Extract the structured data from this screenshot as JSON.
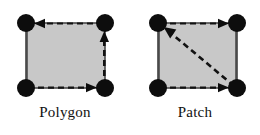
{
  "figure": {
    "background_color": "#ffffff",
    "panels": [
      {
        "id": "polygon",
        "caption": "Polygon",
        "shape": {
          "fill_color": "#c8c8c8",
          "stroke_color": "#4a4a4a",
          "vertices": [
            "top-left",
            "top-right",
            "bottom-right",
            "bottom-left"
          ]
        },
        "vertex_marker": {
          "shape": "filled-circle",
          "color": "#0d0d0d",
          "radius_px": 9,
          "count": 4
        },
        "edges": [
          {
            "name": "top-edge",
            "style": "dashed",
            "arrow": true,
            "direction": "right-to-left"
          },
          {
            "name": "right-edge",
            "style": "dashed",
            "arrow": true,
            "direction": "bottom-to-top"
          },
          {
            "name": "bottom-edge",
            "style": "dashed",
            "arrow": true,
            "direction": "left-to-right"
          },
          {
            "name": "left-edge",
            "style": "solid",
            "arrow": false,
            "direction": "none"
          }
        ]
      },
      {
        "id": "patch",
        "caption": "Patch",
        "shape": {
          "fill_color": "#c8c8c8",
          "stroke_color": "#4a4a4a",
          "vertices": [
            "top-left",
            "top-right",
            "bottom-right",
            "bottom-left"
          ]
        },
        "vertex_marker": {
          "shape": "filled-circle",
          "color": "#0d0d0d",
          "radius_px": 9,
          "count": 4
        },
        "edges": [
          {
            "name": "top-edge",
            "style": "dashed",
            "arrow": true,
            "direction": "left-to-right"
          },
          {
            "name": "bottom-edge",
            "style": "dashed",
            "arrow": true,
            "direction": "left-to-right"
          },
          {
            "name": "diagonal-edge",
            "style": "dashed",
            "arrow": true,
            "direction": "bottom-right-to-top-left"
          },
          {
            "name": "left-edge",
            "style": "solid",
            "arrow": false,
            "direction": "none"
          },
          {
            "name": "right-edge",
            "style": "solid",
            "arrow": false,
            "direction": "none"
          }
        ]
      }
    ],
    "dash_pattern": "6 4",
    "line_color": "#121212",
    "line_width_px": 2.2
  }
}
